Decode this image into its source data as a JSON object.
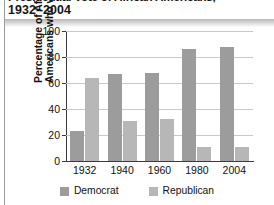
{
  "title": {
    "line1": "Presidential Vote of African Americans,",
    "line2": "1932–2004"
  },
  "legend": {
    "position": "bottom-center",
    "entries": [
      {
        "label": "Democrat",
        "color": "#9c9c9c"
      },
      {
        "label": "Republican",
        "color": "#b7b7b7"
      }
    ]
  },
  "axes": {
    "ylabel_line1": "Percentage of African",
    "ylabel_line2": "Americans who voted",
    "yticks": [
      "100",
      "80",
      "60",
      "40",
      "20",
      "0"
    ],
    "xticks": [
      "1932",
      "1940",
      "1960",
      "1980",
      "2004"
    ]
  },
  "chart_data": {
    "type": "bar",
    "title": "Presidential Vote of African Americans, 1932–2004",
    "xlabel": "",
    "ylabel": "Percentage of African Americans who voted",
    "categories": [
      "1932",
      "1940",
      "1960",
      "1980",
      "2004"
    ],
    "series": [
      {
        "name": "Democrat",
        "color": "#9c9c9c",
        "values": [
          23,
          67,
          68,
          86,
          88
        ]
      },
      {
        "name": "Republican",
        "color": "#b7b7b7",
        "values": [
          64,
          31,
          32,
          11,
          11
        ]
      }
    ],
    "ylim": [
      0,
      100
    ],
    "ytick_values": [
      0,
      20,
      40,
      60,
      80,
      100
    ],
    "grid": true,
    "legend_position": "bottom-center"
  }
}
